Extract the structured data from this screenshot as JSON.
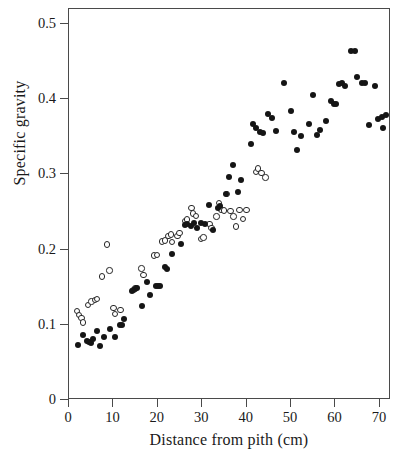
{
  "chart_data": {
    "type": "scatter",
    "title": "",
    "xlabel": "Distance from pith (cm)",
    "ylabel": "Specific gravity",
    "xlim": [
      0,
      72.5
    ],
    "ylim": [
      0,
      0.52
    ],
    "xticks": [
      0,
      10,
      20,
      30,
      40,
      50,
      60,
      70
    ],
    "xtick_labels": [
      "0",
      "10",
      "20",
      "30",
      "40",
      "50",
      "60",
      "70"
    ],
    "yticks": [
      0,
      0.1,
      0.2,
      0.3,
      0.4,
      0.5
    ],
    "ytick_labels": [
      "0",
      "0.1",
      "0.2",
      "0.3",
      "0.4",
      "0.5"
    ],
    "grid": false,
    "legend": "none",
    "marker_colors": {
      "filled": "#151515",
      "open_edge": "#262626",
      "open_fill": "#ffffff"
    },
    "frame": "box",
    "series": [
      {
        "name": "open-circles",
        "marker": "open circle",
        "points": [
          [
            1.8,
            0.118
          ],
          [
            2.3,
            0.113
          ],
          [
            2.8,
            0.109
          ],
          [
            3.2,
            0.103
          ],
          [
            4.3,
            0.126
          ],
          [
            5.1,
            0.131
          ],
          [
            5.8,
            0.133
          ],
          [
            6.3,
            0.134
          ],
          [
            7.4,
            0.164
          ],
          [
            8.5,
            0.207
          ],
          [
            9.1,
            0.172
          ],
          [
            10.0,
            0.122
          ],
          [
            10.3,
            0.114
          ],
          [
            11.6,
            0.12
          ],
          [
            14.5,
            0.146
          ],
          [
            15.0,
            0.149
          ],
          [
            16.3,
            0.175
          ],
          [
            16.8,
            0.166
          ],
          [
            19.1,
            0.192
          ],
          [
            19.8,
            0.193
          ],
          [
            21.0,
            0.211
          ],
          [
            21.6,
            0.212
          ],
          [
            22.4,
            0.218
          ],
          [
            22.9,
            0.22
          ],
          [
            23.2,
            0.21
          ],
          [
            24.4,
            0.218
          ],
          [
            24.9,
            0.222
          ],
          [
            26.2,
            0.238
          ],
          [
            26.5,
            0.24
          ],
          [
            27.6,
            0.255
          ],
          [
            27.9,
            0.248
          ],
          [
            28.6,
            0.245
          ],
          [
            29.7,
            0.214
          ],
          [
            30.3,
            0.216
          ],
          [
            31.6,
            0.234
          ],
          [
            32.1,
            0.229
          ],
          [
            33.2,
            0.244
          ],
          [
            33.8,
            0.262
          ],
          [
            34.3,
            0.253
          ],
          [
            34.9,
            0.252
          ],
          [
            35.6,
            0.274
          ],
          [
            36.4,
            0.251
          ],
          [
            37.0,
            0.244
          ],
          [
            37.6,
            0.231
          ],
          [
            38.4,
            0.253
          ],
          [
            39.2,
            0.241
          ],
          [
            40.0,
            0.253
          ],
          [
            42.1,
            0.303
          ],
          [
            42.6,
            0.308
          ],
          [
            43.3,
            0.302
          ],
          [
            44.2,
            0.296
          ]
        ]
      },
      {
        "name": "filled-circles",
        "marker": "filled circle",
        "points": [
          [
            2.1,
            0.073
          ],
          [
            3.1,
            0.086
          ],
          [
            4.0,
            0.079
          ],
          [
            4.4,
            0.077
          ],
          [
            4.9,
            0.076
          ],
          [
            5.3,
            0.081
          ],
          [
            6.2,
            0.092
          ],
          [
            7.0,
            0.072
          ],
          [
            7.8,
            0.084
          ],
          [
            9.2,
            0.094
          ],
          [
            10.3,
            0.084
          ],
          [
            11.5,
            0.1
          ],
          [
            12.0,
            0.1
          ],
          [
            12.4,
            0.108
          ],
          [
            14.2,
            0.145
          ],
          [
            14.8,
            0.147
          ],
          [
            15.3,
            0.149
          ],
          [
            16.4,
            0.125
          ],
          [
            17.6,
            0.157
          ],
          [
            18.2,
            0.14
          ],
          [
            19.6,
            0.151
          ],
          [
            20.1,
            0.152
          ],
          [
            20.6,
            0.151
          ],
          [
            21.6,
            0.177
          ],
          [
            22.1,
            0.174
          ],
          [
            23.1,
            0.194
          ],
          [
            25.2,
            0.207
          ],
          [
            26.2,
            0.233
          ],
          [
            26.6,
            0.234
          ],
          [
            27.4,
            0.232
          ],
          [
            28.2,
            0.235
          ],
          [
            28.8,
            0.229
          ],
          [
            29.8,
            0.236
          ],
          [
            30.6,
            0.234
          ],
          [
            31.6,
            0.26
          ],
          [
            32.4,
            0.226
          ],
          [
            33.6,
            0.256
          ],
          [
            34.1,
            0.258
          ],
          [
            35.3,
            0.274
          ],
          [
            36.1,
            0.296
          ],
          [
            37.0,
            0.312
          ],
          [
            38.0,
            0.277
          ],
          [
            38.8,
            0.292
          ],
          [
            40.9,
            0.34
          ],
          [
            41.5,
            0.367
          ],
          [
            42.2,
            0.362
          ],
          [
            42.9,
            0.357
          ],
          [
            43.6,
            0.355
          ],
          [
            44.8,
            0.381
          ],
          [
            45.8,
            0.375
          ],
          [
            46.5,
            0.358
          ],
          [
            48.4,
            0.422
          ],
          [
            49.9,
            0.385
          ],
          [
            50.7,
            0.357
          ],
          [
            51.4,
            0.332
          ],
          [
            52.3,
            0.351
          ],
          [
            54.0,
            0.367
          ],
          [
            54.9,
            0.406
          ],
          [
            55.8,
            0.352
          ],
          [
            56.6,
            0.359
          ],
          [
            57.9,
            0.371
          ],
          [
            58.9,
            0.397
          ],
          [
            59.6,
            0.393
          ],
          [
            60.2,
            0.394
          ],
          [
            60.8,
            0.42
          ],
          [
            61.4,
            0.421
          ],
          [
            62.2,
            0.418
          ],
          [
            63.4,
            0.464
          ],
          [
            64.5,
            0.464
          ],
          [
            64.8,
            0.429
          ],
          [
            65.9,
            0.421
          ],
          [
            66.6,
            0.422
          ],
          [
            67.6,
            0.366
          ],
          [
            68.8,
            0.417
          ],
          [
            69.6,
            0.374
          ],
          [
            70.4,
            0.377
          ],
          [
            70.6,
            0.362
          ],
          [
            71.3,
            0.379
          ]
        ]
      }
    ]
  }
}
